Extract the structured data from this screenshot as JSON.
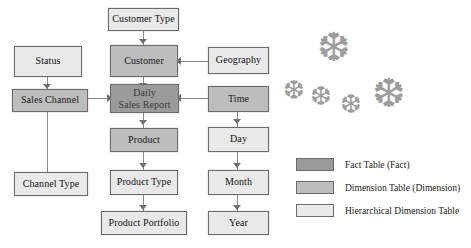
{
  "diagram": {
    "colors": {
      "fact": "#9b9b9b",
      "dimension": "#bdbdbd",
      "hierarchical_dimension": "#e9e9e9",
      "border": "#6b6b6b",
      "connector": "#8a8a8a",
      "snowflake": "#9d9d9d",
      "background": "#ffffff"
    },
    "nodes": [
      {
        "id": "customer_type",
        "label": "Customer Type",
        "type": "hierarchical_dimension"
      },
      {
        "id": "status",
        "label": "Status",
        "type": "hierarchical_dimension"
      },
      {
        "id": "customer",
        "label": "Customer",
        "type": "dimension"
      },
      {
        "id": "geography",
        "label": "Geography",
        "type": "hierarchical_dimension"
      },
      {
        "id": "sales_channel",
        "label": "Sales Channel",
        "type": "dimension"
      },
      {
        "id": "daily_sales_report",
        "label_line1": "Daily",
        "label_line2": "Sales Report",
        "label": "Daily Sales Report",
        "type": "fact"
      },
      {
        "id": "time",
        "label": "Time",
        "type": "dimension"
      },
      {
        "id": "product",
        "label": "Product",
        "type": "dimension"
      },
      {
        "id": "day",
        "label": "Day",
        "type": "hierarchical_dimension"
      },
      {
        "id": "channel_type",
        "label": "Channel Type",
        "type": "hierarchical_dimension"
      },
      {
        "id": "product_type",
        "label": "Product Type",
        "type": "hierarchical_dimension"
      },
      {
        "id": "month",
        "label": "Month",
        "type": "hierarchical_dimension"
      },
      {
        "id": "product_portfolio",
        "label": "Product Portfolio",
        "type": "hierarchical_dimension"
      },
      {
        "id": "year",
        "label": "Year",
        "type": "hierarchical_dimension"
      }
    ],
    "edges": [
      {
        "from": "customer_type",
        "to": "customer",
        "direction": "down"
      },
      {
        "from": "status",
        "to": "sales_channel",
        "direction": "down"
      },
      {
        "from": "customer",
        "to": "daily_sales_report",
        "direction": "down"
      },
      {
        "from": "geography",
        "to": "customer",
        "direction": "left"
      },
      {
        "from": "sales_channel",
        "to": "daily_sales_report",
        "direction": "left"
      },
      {
        "from": "time",
        "to": "daily_sales_report",
        "direction": "left"
      },
      {
        "from": "sales_channel",
        "to": "channel_type",
        "direction": "down"
      },
      {
        "from": "daily_sales_report",
        "to": "product",
        "direction": "down"
      },
      {
        "from": "time",
        "to": "day",
        "direction": "down"
      },
      {
        "from": "product",
        "to": "product_type",
        "direction": "down"
      },
      {
        "from": "day",
        "to": "month",
        "direction": "down"
      },
      {
        "from": "product_type",
        "to": "product_portfolio",
        "direction": "down"
      },
      {
        "from": "month",
        "to": "year",
        "direction": "down"
      }
    ],
    "snowflakes": [
      {
        "id": "flake-1",
        "x": 317,
        "y": 28,
        "size": 40
      },
      {
        "id": "flake-2",
        "x": 283,
        "y": 78,
        "size": 26
      },
      {
        "id": "flake-3",
        "x": 310,
        "y": 84,
        "size": 26
      },
      {
        "id": "flake-4",
        "x": 340,
        "y": 92,
        "size": 26
      },
      {
        "id": "flake-5",
        "x": 372,
        "y": 74,
        "size": 40
      }
    ]
  },
  "legend": {
    "items": [
      {
        "id": "fact",
        "label": "Fact Table (Fact)",
        "color": "#9b9b9b"
      },
      {
        "id": "dimension",
        "label": "Dimension Table (Dimension)",
        "color": "#bdbdbd"
      },
      {
        "id": "hierarchical",
        "label": "Hierarchical Dimension Table",
        "color": "#e9e9e9"
      }
    ]
  }
}
